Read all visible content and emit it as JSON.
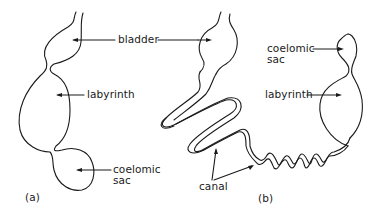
{
  "figure": {
    "panel_a": {
      "caption": "(a)",
      "labels": {
        "bladder": "bladder",
        "labyrinth": "labyrinth",
        "coelomic_sac_line1": "coelomic",
        "coelomic_sac_line2": "sac"
      }
    },
    "panel_b": {
      "caption": "(b)",
      "labels": {
        "coelomic_sac_line1": "coelomic",
        "coelomic_sac_line2": "sac",
        "labyrinth": "labyrinth",
        "canal": "canal"
      }
    },
    "colors": {
      "stroke": "#1a1a1a",
      "background": "#ffffff"
    }
  }
}
